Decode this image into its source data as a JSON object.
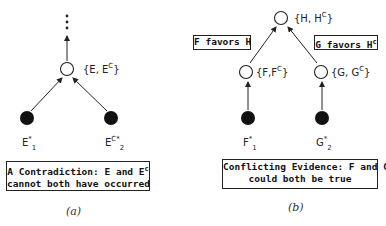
{
  "panel_a": {
    "node_top_label_base": "{E, E",
    "node_top_label_sup": "C",
    "node_top_label_end": "}",
    "evidence_1_base": "E",
    "evidence_1_star": "*",
    "evidence_1_sub": "1",
    "evidence_2_base": "E",
    "evidence_2_sup": "C*",
    "evidence_2_sub": "2",
    "box_line1_base": "A Contradiction: E and E",
    "box_line1_sup": "c",
    "box_line2": "cannot both have occurred",
    "caption": "(a)"
  },
  "panel_b": {
    "top_label_base": "{H, H",
    "top_label_sup": "C",
    "top_label_end": "}",
    "left_favor_label": "F favors H",
    "right_favor_base": "G favors H",
    "right_favor_sup": "c",
    "node_f_label_base": "{F,F",
    "node_f_label_sup": "C",
    "node_f_label_end": "}",
    "node_g_label_base": "{G, G",
    "node_g_label_sup": "C",
    "node_g_label_end": "}",
    "evidence_f_base": "F",
    "evidence_f_star": "*",
    "evidence_f_sub": "1",
    "evidence_g_base": "G",
    "evidence_g_star": "*",
    "evidence_g_sub": "2",
    "box_line1": "Conflicting Evidence: F and G",
    "box_line2": "could both be true",
    "caption": "(b)"
  }
}
